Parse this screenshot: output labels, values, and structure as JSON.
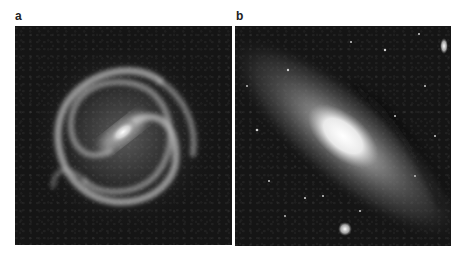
{
  "figure": {
    "panels": [
      {
        "label": "a",
        "description": "Face-on barred spiral galaxy with two prominent spiral arms, grayscale"
      },
      {
        "label": "b",
        "description": "Inclined spiral galaxy with bright elongated core and dust lanes, surrounded by foreground stars and two small satellite galaxies, grayscale"
      }
    ]
  },
  "colors": {
    "background": "#ffffff",
    "sky": "#151515",
    "label": "#222222"
  }
}
